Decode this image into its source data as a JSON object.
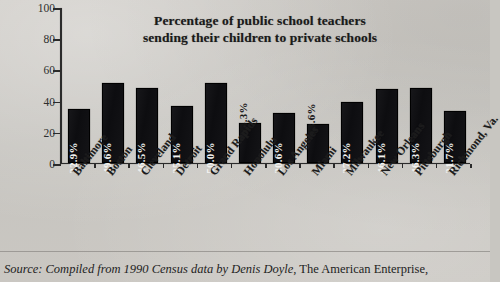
{
  "chart_data": {
    "type": "bar",
    "title": "Percentage of public school teachers sending their children to private schools",
    "title_line1": "Percentage of public school teachers",
    "title_line2": "sending their children to private schools",
    "xlabel": "",
    "ylabel": "",
    "ylim": [
      0,
      100
    ],
    "yticks": [
      0,
      20,
      40,
      60,
      80,
      100
    ],
    "ytick_labels": [
      "0",
      "20",
      "40",
      "60",
      "80",
      "100"
    ],
    "grid": false,
    "legend": false,
    "bar_color": "#101014",
    "categories": [
      "Baltimore",
      "Boston",
      "Cleveland",
      "Detroit",
      "Grand Rapids",
      "Honolulu",
      "Los Angeles",
      "Miami",
      "Milwaukee",
      "New Orleans",
      "Pittsburgh",
      "Richmond, Va."
    ],
    "values": [
      32.9,
      49.6,
      46.5,
      35.1,
      50.0,
      24.3,
      30.6,
      23.6,
      37.2,
      46.1,
      46.3,
      31.7
    ],
    "data_labels": [
      "32.9%",
      "49.6%",
      "46.5%",
      "35.1%",
      "50.0%",
      "24.3%",
      "30.6%",
      "23.6%",
      "37.2%",
      "46.1%",
      "46.3%",
      "31.7%"
    ],
    "data_label_placement": [
      "inside",
      "inside",
      "inside",
      "inside",
      "inside",
      "outside",
      "inside",
      "outside",
      "inside",
      "inside",
      "inside",
      "inside"
    ]
  },
  "source": {
    "italic_part": "Source: Compiled from 1990 Census data by Denis Doyle,",
    "roman_part": " The American Enterprise,"
  }
}
